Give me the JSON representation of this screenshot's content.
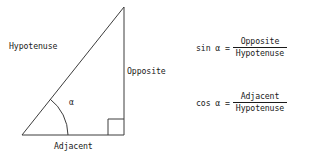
{
  "canvas": {
    "width": 313,
    "height": 161,
    "background": "#ffffff",
    "stroke_color": "#3c3c3c",
    "text_color": "#1a1a1a"
  },
  "diagram": {
    "labels": {
      "hypotenuse": "Hypotenuse",
      "opposite": "Opposite",
      "adjacent": "Adjacent",
      "angle": "α"
    },
    "geometry": {
      "left_vertex": [
        22,
        135
      ],
      "right_vertex": [
        124,
        135
      ],
      "apex": [
        124,
        7
      ],
      "right_angle_marker": [
        108,
        119,
        16,
        16
      ],
      "angle_arc_radius": 46
    }
  },
  "formulas": [
    {
      "id": "sin",
      "lhs": "sin α =",
      "numerator": "Opposite",
      "denominator": "Hypotenuse"
    },
    {
      "id": "cos",
      "lhs": "cos α =",
      "numerator": "Adjacent",
      "denominator": "Hypotenuse"
    }
  ]
}
